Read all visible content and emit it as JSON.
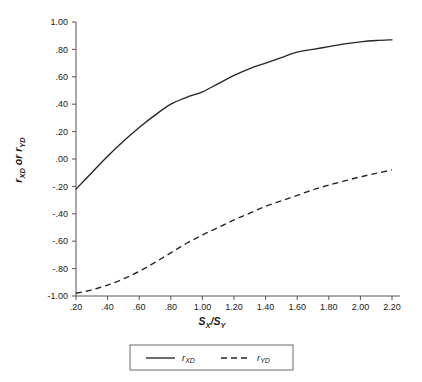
{
  "chart_data": {
    "type": "line",
    "title": "",
    "xlabel": "S_X/S_Y",
    "ylabel": "r_XD or r_YD",
    "xlim": [
      0.1,
      2.3
    ],
    "ylim": [
      -1.0,
      1.0
    ],
    "grid": false,
    "legend_position": "bottom-outside",
    "x": [
      0.2,
      0.3,
      0.4,
      0.5,
      0.6,
      0.7,
      0.8,
      0.9,
      1.0,
      1.1,
      1.2,
      1.3,
      1.4,
      1.5,
      1.6,
      1.7,
      1.8,
      1.9,
      2.0,
      2.1,
      2.2
    ],
    "xticks": [
      ".20",
      ".40",
      ".60",
      ".80",
      "1.00",
      "1.20",
      "1.40",
      "1.60",
      "1.80",
      "2.00",
      "2.20"
    ],
    "xtick_values": [
      0.2,
      0.4,
      0.6,
      0.8,
      1.0,
      1.2,
      1.4,
      1.6,
      1.8,
      2.0,
      2.2
    ],
    "yticks": [
      "1.00",
      ".80",
      ".60",
      ".40",
      ".20",
      ".00",
      "-.20",
      "-.40",
      "-.60",
      "-.80",
      "-1.00"
    ],
    "ytick_values": [
      1.0,
      0.8,
      0.6,
      0.4,
      0.2,
      0.0,
      -0.2,
      -0.4,
      -0.6,
      -0.8,
      -1.0
    ],
    "series": [
      {
        "name": "r_XD",
        "label_main": "r",
        "label_sub": "XD",
        "style": "solid",
        "color": "#262626",
        "values": [
          -0.22,
          -0.1,
          0.02,
          0.13,
          0.23,
          0.32,
          0.4,
          0.45,
          0.49,
          0.55,
          0.61,
          0.66,
          0.7,
          0.74,
          0.78,
          0.8,
          0.82,
          0.84,
          0.855,
          0.865,
          0.87
        ]
      },
      {
        "name": "r_YD",
        "label_main": "r",
        "label_sub": "YD",
        "style": "dashed",
        "color": "#262626",
        "values": [
          -0.98,
          -0.955,
          -0.92,
          -0.875,
          -0.82,
          -0.755,
          -0.685,
          -0.615,
          -0.555,
          -0.5,
          -0.445,
          -0.395,
          -0.345,
          -0.305,
          -0.265,
          -0.225,
          -0.19,
          -0.16,
          -0.13,
          -0.105,
          -0.08
        ]
      }
    ]
  },
  "axis": {
    "y_title_main_1": "r",
    "y_title_sub_1": "XD",
    "y_title_conn": " or ",
    "y_title_main_2": "r",
    "y_title_sub_2": "YD",
    "x_title_main_1": "S",
    "x_title_sub_1": "X",
    "x_title_slash": "/",
    "x_title_main_2": "S",
    "x_title_sub_2": "Y"
  },
  "legend": {
    "entries": [
      {
        "label_main": "r",
        "label_sub": "XD",
        "style": "solid"
      },
      {
        "label_main": "r",
        "label_sub": "YD",
        "style": "dashed"
      }
    ]
  }
}
